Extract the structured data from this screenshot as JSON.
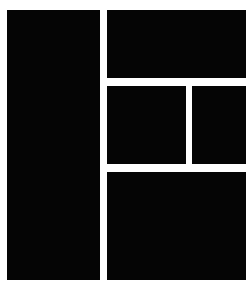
{
  "canvas": {
    "width": 252,
    "height": 290,
    "background_color": "#ffffff",
    "block_color": "#050505",
    "gutter_color": "#ffffff"
  },
  "layout": {
    "type": "wireframe-block-layout",
    "description": "Solid filled block layout mockup",
    "columns": 2,
    "gutter_px": 7,
    "margin_px": 7
  },
  "panels": [
    {
      "name": "sidebar",
      "label": "",
      "x": 7,
      "y": 10,
      "width": 93,
      "height": 270,
      "color": "#050505"
    },
    {
      "name": "header-banner",
      "label": "",
      "x": 107,
      "y": 10,
      "width": 139,
      "height": 68,
      "color": "#050505"
    },
    {
      "name": "content-left",
      "label": "",
      "x": 107,
      "y": 86,
      "width": 79,
      "height": 78,
      "color": "#050505"
    },
    {
      "name": "content-right",
      "label": "",
      "x": 192,
      "y": 86,
      "width": 54,
      "height": 78,
      "color": "#050505"
    },
    {
      "name": "footer",
      "label": "",
      "x": 107,
      "y": 172,
      "width": 139,
      "height": 108,
      "color": "#050505"
    }
  ]
}
